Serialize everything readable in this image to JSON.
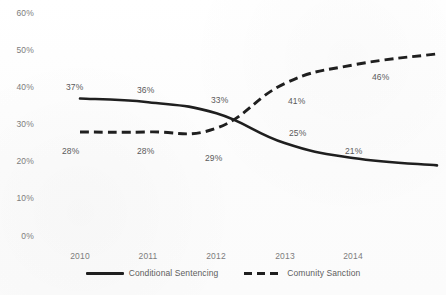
{
  "chart_data": {
    "type": "line",
    "title": "",
    "subtitle": "",
    "xlabel": "",
    "ylabel": "",
    "categories": [
      "2010",
      "2011",
      "2012",
      "2013",
      "2014"
    ],
    "ylim": [
      0,
      60
    ],
    "yticks": [
      "0%",
      "10%",
      "20%",
      "30%",
      "40%",
      "50%",
      "60%"
    ],
    "ytick_values": [
      0,
      10,
      20,
      30,
      40,
      50,
      60
    ],
    "grid": false,
    "legend_position": "bottom",
    "series": [
      {
        "name": "Conditional Sentencing",
        "style": "solid",
        "color": "#1f1f1f",
        "values": [
          37,
          36,
          33,
          25,
          21
        ],
        "labels": [
          "37%",
          "36%",
          "33%",
          "25%",
          "21%"
        ],
        "trailing_value": 19
      },
      {
        "name": "Comunity Sanction",
        "style": "dashed",
        "color": "#1f1f1f",
        "values": [
          28,
          28,
          29,
          41,
          46
        ],
        "labels": [
          "28%",
          "28%",
          "29%",
          "41%",
          "46%"
        ],
        "trailing_value": 49
      }
    ]
  },
  "axis": {
    "y": {
      "t60": "60%",
      "t50": "50%",
      "t40": "40%",
      "t30": "30%",
      "t20": "20%",
      "t10": "10%",
      "t0": "0%"
    },
    "x": {
      "y2010": "2010",
      "y2011": "2011",
      "y2012": "2012",
      "y2013": "2013",
      "y2014": "2014"
    }
  },
  "data_labels": {
    "cs_2010": "37%",
    "cs_2011": "36%",
    "cs_2012": "33%",
    "cs_2013": "25%",
    "cs_2014": "21%",
    "ca_2010": "28%",
    "ca_2011": "28%",
    "ca_2012": "29%",
    "ca_2013": "41%",
    "ca_2014": "46%"
  },
  "legend": {
    "series1_label": "Conditional Sentencing",
    "series2_label": "Comunity Sanction"
  },
  "colors": {
    "line": "#1f1f1f",
    "tick_text": "#7d7d7d",
    "label_text": "#5a5a5a",
    "background": "#ffffff"
  }
}
